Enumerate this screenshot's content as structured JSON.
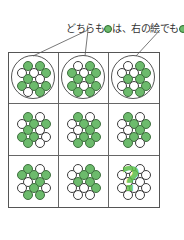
{
  "caption": {
    "part1": "どちらも",
    "part2": "は、右の絵でも"
  },
  "colors": {
    "green": "#6cbb6c",
    "white": "#ffffff",
    "line": "#555555"
  },
  "question_mark": "?",
  "grid": {
    "rows": 3,
    "cols": 3,
    "circle_layout": "12 circles per cell in staggered rows of 2,3,2,3,2",
    "cells": [
      {
        "row": 0,
        "col": 0,
        "circled": true,
        "pattern": [
          1,
          1,
          0,
          0,
          1,
          1,
          0,
          1,
          1,
          1,
          0,
          1,
          0
        ]
      },
      {
        "row": 0,
        "col": 1,
        "circled": true,
        "pattern": [
          0,
          1,
          1,
          0,
          1,
          1,
          1,
          1,
          0,
          1,
          1,
          1,
          1
        ]
      },
      {
        "row": 0,
        "col": 2,
        "circled": true,
        "pattern": [
          0,
          1,
          0,
          0,
          1,
          1,
          1,
          0,
          0,
          1,
          1,
          1,
          0
        ]
      },
      {
        "row": 1,
        "col": 0,
        "circled": false,
        "pattern": [
          1,
          0,
          0,
          1,
          1,
          1,
          0,
          1,
          1,
          0,
          1,
          0,
          0
        ]
      },
      {
        "row": 1,
        "col": 1,
        "circled": false,
        "pattern": [
          1,
          0,
          0,
          1,
          1,
          0,
          1,
          0,
          1,
          1,
          1,
          1,
          1
        ]
      },
      {
        "row": 1,
        "col": 2,
        "circled": false,
        "pattern": [
          1,
          0,
          0,
          1,
          1,
          0,
          1,
          0,
          1,
          1,
          1,
          0,
          0
        ]
      },
      {
        "row": 2,
        "col": 0,
        "circled": false,
        "pattern": [
          1,
          0,
          1,
          1,
          1,
          0,
          1,
          0,
          1,
          0,
          1,
          1,
          1
        ]
      },
      {
        "row": 2,
        "col": 1,
        "circled": false,
        "pattern": [
          0,
          1,
          0,
          1,
          1,
          1,
          1,
          0,
          0,
          1,
          0,
          0,
          0
        ]
      },
      {
        "row": 2,
        "col": 2,
        "circled": false,
        "question": true,
        "pattern": [
          0,
          0,
          0,
          0,
          0,
          0,
          0,
          0,
          0,
          0,
          0,
          0,
          0
        ]
      }
    ]
  }
}
